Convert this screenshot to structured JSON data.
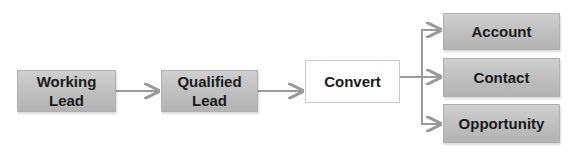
{
  "diagram": {
    "nodes": [
      {
        "id": "working_lead",
        "label": "Working\nLead",
        "lines": [
          "Working",
          "Lead"
        ],
        "style": "gray"
      },
      {
        "id": "qualified_lead",
        "label": "Qualified\nLead",
        "lines": [
          "Qualified",
          "Lead"
        ],
        "style": "gray"
      },
      {
        "id": "convert",
        "label": "Convert",
        "lines": [
          "Convert"
        ],
        "style": "white"
      },
      {
        "id": "account",
        "label": "Account",
        "lines": [
          "Account"
        ],
        "style": "gray"
      },
      {
        "id": "contact",
        "label": "Contact",
        "lines": [
          "Contact"
        ],
        "style": "gray"
      },
      {
        "id": "opportunity",
        "label": "Opportunity",
        "lines": [
          "Opportunity"
        ],
        "style": "gray"
      }
    ],
    "edges": [
      {
        "from": "working_lead",
        "to": "qualified_lead"
      },
      {
        "from": "qualified_lead",
        "to": "convert"
      },
      {
        "from": "convert",
        "to": "account"
      },
      {
        "from": "convert",
        "to": "contact"
      },
      {
        "from": "convert",
        "to": "opportunity"
      }
    ],
    "colors": {
      "box_fill": "#c2c2c2",
      "arrow": "#9a9a9a",
      "text": "#1a1a1a"
    }
  }
}
